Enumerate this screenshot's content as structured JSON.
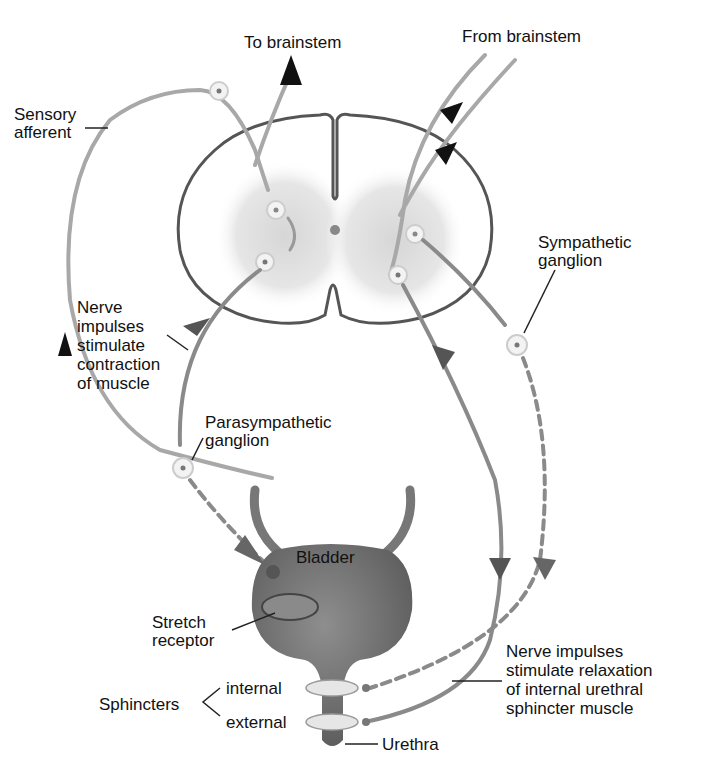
{
  "diagram": {
    "labels": {
      "to_brainstem": "To brainstem",
      "from_brainstem": "From brainstem",
      "sensory_afferent": [
        "Sensory",
        "afferent"
      ],
      "sympathetic_ganglion": [
        "Sympathetic",
        "ganglion"
      ],
      "nerve_contraction": [
        "Nerve",
        "impulses",
        "stimulate",
        "contraction",
        "of muscle"
      ],
      "parasympathetic_ganglion": [
        "Parasympathetic",
        "ganglion"
      ],
      "bladder": "Bladder",
      "stretch_receptor": [
        "Stretch",
        "receptor"
      ],
      "sphincters": "Sphincters",
      "internal": "internal",
      "external": "external",
      "urethra": "Urethra",
      "nerve_relaxation": [
        "Nerve impulses",
        "stimulate relaxation",
        "of internal urethral",
        "sphincter muscle"
      ]
    },
    "colors": {
      "nerve_light": "#a8a8a8",
      "nerve_mid": "#7a7a7a",
      "arrow_dark": "#111111",
      "cord_outline": "#555555",
      "gray_matter": "#e2e2e2",
      "bladder_fill": "#777777",
      "sphincter_fill": "#e6e6e6"
    }
  }
}
